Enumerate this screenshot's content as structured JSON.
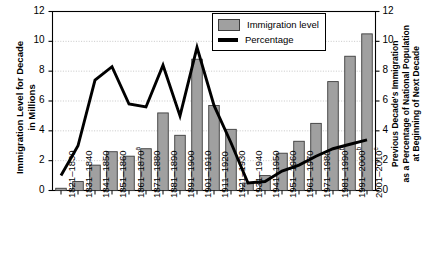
{
  "chart_data": {
    "type": "bar",
    "title": "",
    "xlabel": "",
    "ylabel": "Immigration Level for Decade\nin Millions",
    "y2label": "Previous Decade's Immigration\nas a Percentage of National Population\nat Beginning of Next Decade",
    "ylim": [
      0,
      12
    ],
    "y2lim": [
      0,
      12
    ],
    "yticks": [
      0,
      2,
      4,
      6,
      8,
      10,
      12
    ],
    "y2ticks": [
      0,
      2,
      4,
      6,
      8,
      10,
      12
    ],
    "grid": true,
    "legend_position": "top-right",
    "categories": [
      "1821–1830",
      "1831–1840",
      "1841–1850",
      "1851–1860",
      "1861–1870",
      "1871–1880",
      "1881–1890",
      "1891–1900",
      "1901–1910",
      "1911–1920",
      "1921–1930",
      "1931–1940",
      "1941–1950",
      "1951–1960",
      "1961–1970",
      "1971–1980",
      "1981–1990",
      "1991–2000",
      "2001–2010"
    ],
    "category_footnotes": [
      "",
      "",
      "",
      "",
      "a",
      "",
      "",
      "",
      "",
      "",
      "",
      "",
      "",
      "",
      "",
      "",
      "b",
      "b",
      "c"
    ],
    "series": [
      {
        "name": "Immigration level",
        "kind": "bar",
        "axis": "left",
        "unit": "millions",
        "color": "#a0a0a0",
        "edge_color": "#3c3c3c",
        "values": [
          0.15,
          0.6,
          1.7,
          2.6,
          2.3,
          2.8,
          5.2,
          3.7,
          8.8,
          5.7,
          4.1,
          0.5,
          1.0,
          2.5,
          3.3,
          4.5,
          7.3,
          9.0,
          10.5
        ]
      },
      {
        "name": "Percentage",
        "kind": "line",
        "axis": "right",
        "unit": "percent",
        "color": "#000000",
        "values": [
          1.0,
          3.0,
          7.4,
          8.3,
          5.8,
          5.6,
          8.4,
          5.0,
          9.6,
          5.7,
          3.2,
          0.5,
          0.6,
          1.3,
          1.7,
          2.3,
          2.8,
          3.1,
          3.4
        ]
      }
    ],
    "legend": [
      {
        "label": "Immigration level",
        "marker": "bar-swatch"
      },
      {
        "label": "Percentage",
        "marker": "line-swatch"
      }
    ]
  }
}
